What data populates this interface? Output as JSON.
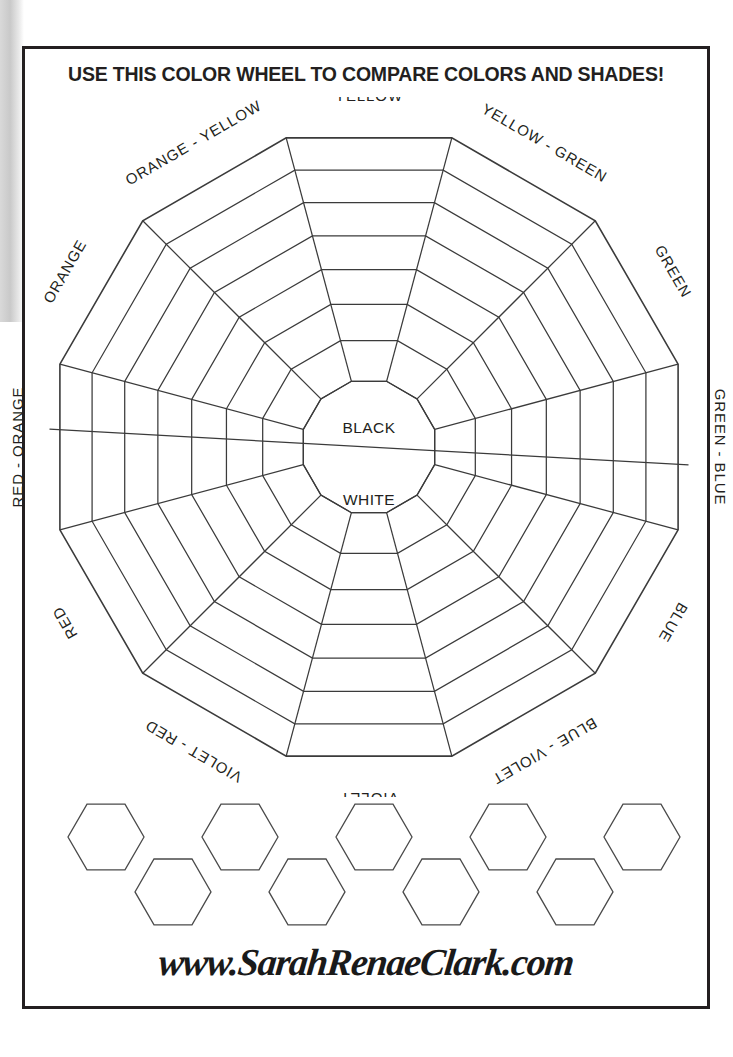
{
  "page": {
    "title": "USE THIS COLOR WHEEL TO COMPARE COLORS AND SHADES!",
    "credit": "www.SarahRenaeClark.com",
    "ink_color": "#231f20",
    "line_color": "#3b3b3b",
    "background": "#ffffff"
  },
  "chart_data": {
    "type": "pie",
    "title": "USE THIS COLOR WHEEL TO COMPARE COLORS AND SHADES!",
    "subtitle": "",
    "xlabel": "",
    "ylabel": "",
    "wheel": {
      "shape": "dodecagon",
      "sector_count": 12,
      "ring_count": 7,
      "has_center_core": true,
      "core_split": "diagonal",
      "core_top_label": "BLACK",
      "core_bottom_label": "WHITE",
      "grid": true,
      "legend_position": "around-perimeter",
      "fill": "none",
      "outline_only": true
    },
    "categories": [
      "YELLOW",
      "YELLOW - GREEN",
      "GREEN",
      "GREEN - BLUE",
      "BLUE",
      "BLUE - VIOLET",
      "VIOLET",
      "VIOLET - RED",
      "RED",
      "RED - ORANGE",
      "ORANGE",
      "ORANGE - YELLOW"
    ],
    "values": [
      7,
      7,
      7,
      7,
      7,
      7,
      7,
      7,
      7,
      7,
      7,
      7
    ],
    "annotations": [
      "BLACK",
      "WHITE"
    ]
  },
  "wheel": {
    "center_top_label": "BLACK",
    "center_bottom_label": "WHITE",
    "sectors": [
      {
        "label": "YELLOW",
        "angle": -90,
        "rotate": 0
      },
      {
        "label": "YELLOW - GREEN",
        "angle": -60,
        "rotate": 30
      },
      {
        "label": "GREEN",
        "angle": -30,
        "rotate": 60
      },
      {
        "label": "GREEN - BLUE",
        "angle": 0,
        "rotate": 90
      },
      {
        "label": "BLUE",
        "angle": 30,
        "rotate": 120
      },
      {
        "label": "BLUE - VIOLET",
        "angle": 60,
        "rotate": 150
      },
      {
        "label": "VIOLET",
        "angle": 90,
        "rotate": 180
      },
      {
        "label": "VIOLET - RED",
        "angle": 120,
        "rotate": 210
      },
      {
        "label": "RED",
        "angle": 150,
        "rotate": 240
      },
      {
        "label": "RED - ORANGE",
        "angle": 180,
        "rotate": 270
      },
      {
        "label": "ORANGE",
        "angle": 210,
        "rotate": 300
      },
      {
        "label": "ORANGE - YELLOW",
        "angle": 240,
        "rotate": 330
      }
    ]
  },
  "swatches": {
    "row_top_count": 5,
    "row_bottom_count": 4,
    "orientation": "flat-top-hexagon"
  }
}
